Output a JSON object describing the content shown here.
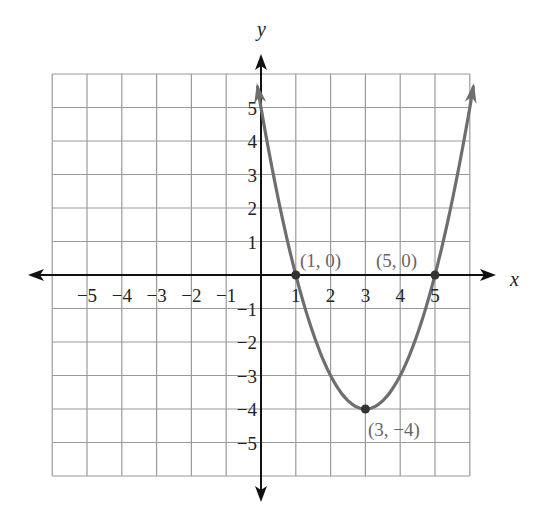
{
  "chart_data": {
    "type": "line",
    "title": "",
    "xlabel": "x",
    "ylabel": "y",
    "xlim": [
      -6,
      6
    ],
    "ylim": [
      -6,
      6
    ],
    "grid": true,
    "x_ticks": [
      "-5",
      "-4",
      "-3",
      "-2",
      "-1",
      "1",
      "2",
      "3",
      "4",
      "5"
    ],
    "y_ticks": [
      "5",
      "4",
      "3",
      "2",
      "1",
      "-1",
      "-2",
      "-3",
      "-4",
      "-5"
    ],
    "series": [
      {
        "name": "parabola",
        "equation": "y = (x-1)(x-5) = x^2 - 6x + 5",
        "color": "#6e6e6e",
        "x": [
          0,
          1,
          2,
          3,
          4,
          5,
          6
        ],
        "y": [
          5,
          0,
          -3,
          -4,
          -3,
          0,
          5
        ]
      }
    ],
    "annotations": [
      {
        "label": "(1, 0)",
        "x": 1,
        "y": 0
      },
      {
        "label": "(5, 0)",
        "x": 5,
        "y": 0
      },
      {
        "label": "(3, −4)",
        "x": 3,
        "y": -4
      }
    ]
  },
  "axes": {
    "x_label": "x",
    "y_label": "y"
  },
  "ticks": {
    "x": [
      {
        "label": "−5",
        "v": -5
      },
      {
        "label": "−4",
        "v": -4
      },
      {
        "label": "−3",
        "v": -3
      },
      {
        "label": "−2",
        "v": -2
      },
      {
        "label": "−1",
        "v": -1
      },
      {
        "label": "1",
        "v": 1
      },
      {
        "label": "2",
        "v": 2
      },
      {
        "label": "3",
        "v": 3
      },
      {
        "label": "4",
        "v": 4
      },
      {
        "label": "5",
        "v": 5
      }
    ],
    "y": [
      {
        "label": "5",
        "v": 5
      },
      {
        "label": "4",
        "v": 4
      },
      {
        "label": "3",
        "v": 3
      },
      {
        "label": "2",
        "v": 2
      },
      {
        "label": "1",
        "v": 1
      },
      {
        "label": "−1",
        "v": -1
      },
      {
        "label": "−2",
        "v": -2
      },
      {
        "label": "−3",
        "v": -3
      },
      {
        "label": "−4",
        "v": -4
      },
      {
        "label": "−5",
        "v": -5
      }
    ]
  },
  "points": [
    {
      "label": "(1, 0)"
    },
    {
      "label": "(5, 0)"
    },
    {
      "label": "(3, −4)"
    }
  ],
  "colors": {
    "grid": "#9a9a9a",
    "axis": "#111111",
    "curve": "#6e6e6e",
    "annotation": "#666666"
  }
}
